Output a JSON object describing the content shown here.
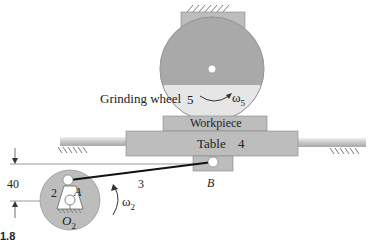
{
  "figure": {
    "caption_partial": "1.8",
    "colors": {
      "link_fill": "#b8b8b8",
      "wheel_dark": "#a8a8a8",
      "wheel_light": "#e4e4e4",
      "table_fill": "#bdbdbd",
      "rod_color": "#cfcfcf",
      "connecting_rod": "#111111"
    }
  },
  "labels": {
    "grinding_wheel": "Grinding wheel",
    "wheel_number": "5",
    "wheel_omega": "ω",
    "wheel_omega_sub": "5",
    "workpiece": "Workpiece",
    "table": "Table",
    "table_number": "4",
    "dimension": "40",
    "crank_number": "2",
    "point_a": "A",
    "rod_number": "3",
    "point_b": "B",
    "crank_omega": "ω",
    "crank_omega_sub": "2",
    "pivot_o": "O",
    "pivot_o_sub": "2",
    "caption": "1.8"
  }
}
